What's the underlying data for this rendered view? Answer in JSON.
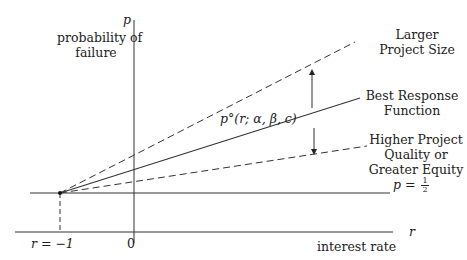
{
  "diagram": {
    "axes": {
      "y_symbol": "p",
      "y_label_line1": "probability of",
      "y_label_line2": "failure",
      "x_symbol": "r",
      "x_label": "interest rate",
      "origin_tick": "0",
      "r_minus_one": "r = −1"
    },
    "lines": {
      "upper_dashed_label_line1": "Larger",
      "upper_dashed_label_line2": "Project Size",
      "solid_label_line1": "Best Response",
      "solid_label_line2": "Function",
      "solid_annotation": "p°(r; α, β, c)",
      "lower_dashed_label_line1": "Higher Project",
      "lower_dashed_label_line2": "Quality or",
      "lower_dashed_label_line3": "Greater Equity",
      "half_line_p": "p = ",
      "half_num": "1",
      "half_den": "2"
    },
    "colors": {
      "ink": "#222222",
      "background": "#ffffff"
    }
  }
}
